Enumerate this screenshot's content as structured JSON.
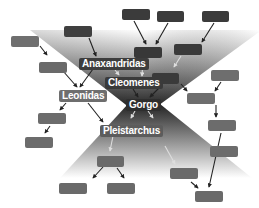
{
  "diagram": {
    "colors": {
      "background": "#ffffff",
      "upper_funnel_dark": "#2b2b2b",
      "upper_funnel_light": "#ffffff",
      "lower_funnel_dark": "#2e2e2e",
      "lower_funnel_light": "#ffffff",
      "box_dark": "#3a3a3a",
      "box_mid": "#5a5a5a",
      "box_light": "#6f6f6f",
      "label_bg": "#555555"
    },
    "labeled_nodes": [
      {
        "id": "anaxandridas",
        "label": "Anaxandridas",
        "x": 79,
        "y": 58,
        "bg": "#3d3d3d"
      },
      {
        "id": "cleomenes",
        "label": "Cleomenes",
        "x": 105,
        "y": 77,
        "bg": "#3a3a3a"
      },
      {
        "id": "leonidas",
        "label": "Leonidas",
        "x": 59,
        "y": 90,
        "bg": "#6e6e6e"
      },
      {
        "id": "gorgo",
        "label": "Gorgo",
        "x": 126,
        "y": 99,
        "bg": "#2e2e2e"
      },
      {
        "id": "pleistarchus",
        "label": "Pleistarchus",
        "x": 100,
        "y": 125,
        "bg": "#5c5c5c"
      }
    ],
    "unlabeled_nodes": [
      {
        "id": "u1",
        "x": 122,
        "y": 9,
        "w": 28,
        "h": 11,
        "bg": "#3b3b3b"
      },
      {
        "id": "u2",
        "x": 157,
        "y": 11,
        "w": 27,
        "h": 11,
        "bg": "#3b3b3b"
      },
      {
        "id": "u3",
        "x": 202,
        "y": 11,
        "w": 27,
        "h": 11,
        "bg": "#3b3b3b"
      },
      {
        "id": "u4",
        "x": 64,
        "y": 26,
        "w": 28,
        "h": 11,
        "bg": "#3f3f3f"
      },
      {
        "id": "u5",
        "x": 11,
        "y": 36,
        "w": 28,
        "h": 11,
        "bg": "#6f6f6f"
      },
      {
        "id": "u6",
        "x": 134,
        "y": 47,
        "w": 28,
        "h": 11,
        "bg": "#383838"
      },
      {
        "id": "u7",
        "x": 174,
        "y": 44,
        "w": 28,
        "h": 11,
        "bg": "#3a3a3a"
      },
      {
        "id": "u8",
        "x": 39,
        "y": 62,
        "w": 28,
        "h": 11,
        "bg": "#6a6a6a"
      },
      {
        "id": "u9",
        "x": 152,
        "y": 73,
        "w": 27,
        "h": 11,
        "bg": "#3a3a3a"
      },
      {
        "id": "u10",
        "x": 211,
        "y": 70,
        "w": 28,
        "h": 11,
        "bg": "#6e6e6e"
      },
      {
        "id": "u11",
        "x": 187,
        "y": 93,
        "w": 28,
        "h": 11,
        "bg": "#6e6e6e"
      },
      {
        "id": "u12",
        "x": 38,
        "y": 113,
        "w": 28,
        "h": 11,
        "bg": "#6c6c6c"
      },
      {
        "id": "u13",
        "x": 208,
        "y": 120,
        "w": 28,
        "h": 11,
        "bg": "#6c6c6c"
      },
      {
        "id": "u14",
        "x": 25,
        "y": 137,
        "w": 28,
        "h": 11,
        "bg": "#6c6c6c"
      },
      {
        "id": "u15",
        "x": 210,
        "y": 146,
        "w": 28,
        "h": 11,
        "bg": "#6c6c6c"
      },
      {
        "id": "u16",
        "x": 97,
        "y": 156,
        "w": 27,
        "h": 11,
        "bg": "#6a6a6a"
      },
      {
        "id": "u17",
        "x": 170,
        "y": 168,
        "w": 28,
        "h": 11,
        "bg": "#6a6a6a"
      },
      {
        "id": "u18",
        "x": 59,
        "y": 183,
        "w": 28,
        "h": 11,
        "bg": "#6a6a6a"
      },
      {
        "id": "u19",
        "x": 107,
        "y": 183,
        "w": 28,
        "h": 11,
        "bg": "#6a6a6a"
      },
      {
        "id": "u20",
        "x": 195,
        "y": 191,
        "w": 28,
        "h": 11,
        "bg": "#6a6a6a"
      }
    ],
    "edges": [
      {
        "from": "u1",
        "to": "u6",
        "x1": 134,
        "y1": 21,
        "x2": 146,
        "y2": 44,
        "color": "#222222"
      },
      {
        "from": "u2",
        "to": "u6",
        "x1": 168,
        "y1": 23,
        "x2": 156,
        "y2": 44,
        "color": "#222222"
      },
      {
        "from": "u3",
        "to": "u7",
        "x1": 214,
        "y1": 23,
        "x2": 202,
        "y2": 42,
        "color": "#222222"
      },
      {
        "from": "u4",
        "to": "anaxandridas",
        "x1": 89,
        "y1": 38,
        "x2": 96,
        "y2": 56,
        "color": "#222222"
      },
      {
        "from": "u5",
        "to": "u8",
        "x1": 40,
        "y1": 46,
        "x2": 47,
        "y2": 55,
        "color": "#222222"
      },
      {
        "from": "u8",
        "to": "leonidas",
        "x1": 63,
        "y1": 71,
        "x2": 77,
        "y2": 87,
        "color": "#222222"
      },
      {
        "from": "anaxandridas",
        "to": "leonidas",
        "x1": 93,
        "y1": 69,
        "x2": 80,
        "y2": 87,
        "color": "#222222"
      },
      {
        "from": "anaxandridas",
        "to": "cleomenes",
        "x1": 115,
        "y1": 70,
        "x2": 119,
        "y2": 75,
        "color": "#dddddd"
      },
      {
        "from": "u6",
        "to": "cleomenes",
        "x1": 143,
        "y1": 59,
        "x2": 142,
        "y2": 76,
        "color": "#dddddd"
      },
      {
        "from": "u7",
        "to": "u9",
        "x1": 181,
        "y1": 56,
        "x2": 174,
        "y2": 67,
        "color": "#dddddd"
      },
      {
        "from": "cleomenes",
        "to": "gorgo",
        "x1": 133,
        "y1": 89,
        "x2": 138,
        "y2": 97,
        "color": "#222222"
      },
      {
        "from": "u9",
        "to": "gorgo",
        "x1": 161,
        "y1": 86,
        "x2": 150,
        "y2": 97,
        "color": "#222222"
      },
      {
        "from": "u9",
        "to": "u11",
        "x1": 181,
        "y1": 84,
        "x2": 187,
        "y2": 91,
        "color": "#222222"
      },
      {
        "from": "u10",
        "to": "u11",
        "x1": 221,
        "y1": 82,
        "x2": 215,
        "y2": 91,
        "color": "#222222"
      },
      {
        "from": "leonidas",
        "to": "u12",
        "x1": 66,
        "y1": 103,
        "x2": 60,
        "y2": 110,
        "color": "#222222"
      },
      {
        "from": "leonidas",
        "to": "pleistarchus",
        "x1": 88,
        "y1": 103,
        "x2": 103,
        "y2": 122,
        "color": "#222222"
      },
      {
        "from": "gorgo",
        "to": "pleistarchus",
        "x1": 135,
        "y1": 111,
        "x2": 131,
        "y2": 118,
        "color": "#dddddd"
      },
      {
        "from": "gorgo",
        "to": "u16",
        "x1": 148,
        "y1": 111,
        "x2": 153,
        "y2": 118,
        "color": "#dddddd"
      },
      {
        "from": "u12",
        "to": "u14",
        "x1": 50,
        "y1": 126,
        "x2": 45,
        "y2": 133,
        "color": "#222222"
      },
      {
        "from": "u11",
        "to": "u13",
        "x1": 216,
        "y1": 105,
        "x2": 216,
        "y2": 117,
        "color": "#222222"
      },
      {
        "from": "pleistarchus",
        "to": "u16",
        "x1": 113,
        "y1": 136,
        "x2": 110,
        "y2": 151,
        "color": "#dddddd"
      },
      {
        "from": "u16b",
        "to": "u17",
        "x1": 165,
        "y1": 146,
        "x2": 175,
        "y2": 164,
        "color": "#dddddd"
      },
      {
        "from": "u16",
        "to": "u18",
        "x1": 103,
        "y1": 167,
        "x2": 93,
        "y2": 178,
        "color": "#222222"
      },
      {
        "from": "u16",
        "to": "u19",
        "x1": 117,
        "y1": 168,
        "x2": 124,
        "y2": 178,
        "color": "#222222"
      },
      {
        "from": "u17",
        "to": "u20",
        "x1": 191,
        "y1": 182,
        "x2": 198,
        "y2": 188,
        "color": "#222222"
      },
      {
        "from": "u13",
        "to": "u20",
        "x1": 221,
        "y1": 133,
        "x2": 209,
        "y2": 187,
        "color": "#222222"
      }
    ]
  }
}
